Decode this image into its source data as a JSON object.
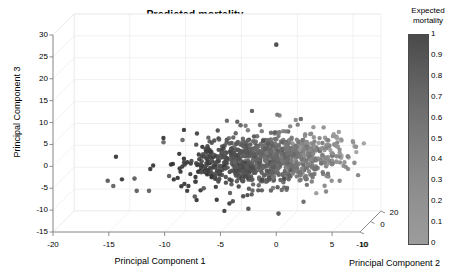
{
  "figure": {
    "title": "Predicted mortality",
    "background": "#ffffff",
    "grid_color": "#e8e8e8",
    "axis_color": "#808080"
  },
  "colorbar": {
    "title_line1": "Expected",
    "title_line2": "mortality",
    "ticks": [
      "1",
      "0.9",
      "0.8",
      "0.7",
      "0.6",
      "0.5",
      "0.4",
      "0.3",
      "0.2",
      "0.1",
      "0"
    ],
    "min": 0,
    "max": 1,
    "color_high": "#4a4a4a",
    "color_low": "#9c9c9c",
    "orientation": "vertical"
  },
  "axes": {
    "x": {
      "title": "Principal Component 1",
      "ticks": [
        "-20",
        "-15",
        "-10",
        "-5",
        "0",
        "5"
      ],
      "values": [
        -20,
        -15,
        -10,
        -5,
        0,
        5
      ],
      "range": [
        -20,
        7.5
      ]
    },
    "y": {
      "title": "Principal Component 3",
      "ticks": [
        "30",
        "25",
        "20",
        "15",
        "10",
        "5",
        "0",
        "-5",
        "-10",
        "-15"
      ],
      "values": [
        30,
        25,
        20,
        15,
        10,
        5,
        0,
        -5,
        -10,
        -15
      ],
      "range": [
        -15,
        30
      ]
    },
    "z": {
      "title": "Principal Component 2",
      "ticks": [
        "-10",
        "10",
        "0",
        "20"
      ],
      "values": [
        -10,
        10,
        0,
        20
      ],
      "range": [
        -10,
        20
      ]
    }
  },
  "chart_data": {
    "type": "scatter",
    "title": "Predicted mortality",
    "xlabel": "Principal Component 1",
    "ylabel": "Principal Component 3",
    "zlabel": "Principal Component 2",
    "colorbar_label": "Expected mortality",
    "projection": "3d",
    "xlim": [
      -20,
      7.5
    ],
    "ylim": [
      -15,
      30
    ],
    "zlim": [
      -10,
      20
    ],
    "grid": true,
    "legend": "none",
    "colormap": "gray_reversed",
    "marker": "filled-circle",
    "marker_size": 4,
    "n_points": 1000,
    "color_variable": "expected mortality",
    "color_range": [
      0,
      1
    ],
    "annotations": [
      {
        "label": "outlier",
        "x": 0,
        "y": 28,
        "color": 0.75
      }
    ],
    "points_sample": [
      {
        "x": 0.0,
        "y": 27.8,
        "c": 0.78
      },
      {
        "x": -15.1,
        "y": -3.3,
        "c": 0.62
      },
      {
        "x": -14.6,
        "y": -4.5,
        "c": 0.55
      },
      {
        "x": -12.7,
        "y": -2.8,
        "c": 0.6
      },
      {
        "x": -12.5,
        "y": -5.6,
        "c": 0.58
      },
      {
        "x": -11.4,
        "y": -5.6,
        "c": 0.57
      },
      {
        "x": -10.1,
        "y": 5.5,
        "c": 0.5
      },
      {
        "x": -8.4,
        "y": 6.0,
        "c": 0.52
      },
      {
        "x": -9.6,
        "y": -2.2,
        "c": 0.6
      },
      {
        "x": -7.3,
        "y": -6.9,
        "c": 0.64
      },
      {
        "x": -6.5,
        "y": -5.0,
        "c": 0.63
      },
      {
        "x": -5.0,
        "y": 2.0,
        "c": 0.66
      },
      {
        "x": -4.0,
        "y": -1.0,
        "c": 0.7
      },
      {
        "x": -3.2,
        "y": 9.4,
        "c": 0.55
      },
      {
        "x": -2.5,
        "y": -9.7,
        "c": 0.68
      },
      {
        "x": -1.0,
        "y": 4.0,
        "c": 0.58
      },
      {
        "x": 0.2,
        "y": -10.8,
        "c": 0.66
      },
      {
        "x": 1.0,
        "y": 3.0,
        "c": 0.42
      },
      {
        "x": 2.2,
        "y": 10.8,
        "c": 0.5
      },
      {
        "x": 3.5,
        "y": 1.5,
        "c": 0.35
      },
      {
        "x": 5.0,
        "y": 0.5,
        "c": 0.3
      },
      {
        "x": 6.4,
        "y": 2.3,
        "c": 0.25
      },
      {
        "x": 7.0,
        "y": 0.8,
        "c": 0.22
      }
    ]
  }
}
